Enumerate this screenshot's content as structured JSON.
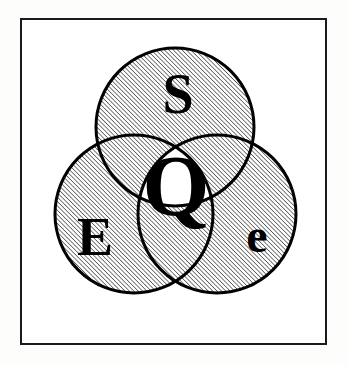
{
  "figure": {
    "background_color": "#fdfdfb",
    "ink_color": "#000000"
  },
  "frame": {
    "name": "outer-border",
    "x": 21,
    "y": 19,
    "width": 305,
    "height": 325,
    "stroke_width": 2,
    "stroke_color": "#1a1a1a",
    "fill_color": "#ffffff"
  },
  "hatch": {
    "angle_degrees": 45,
    "direction": "forward-slash",
    "spacing_px": 3.1,
    "line_width_px": 1.1,
    "line_color": "#111111",
    "background_color": "#ffffff"
  },
  "circles": [
    {
      "id": "circle-top",
      "label": "S",
      "label_case": "uppercase",
      "cx": 175,
      "cy": 127,
      "r": 79,
      "stroke_width": 3,
      "fill": "hatched"
    },
    {
      "id": "circle-left",
      "label": "E",
      "label_case": "uppercase",
      "cx": 134,
      "cy": 214,
      "r": 79,
      "stroke_width": 3,
      "fill": "hatched"
    },
    {
      "id": "circle-right",
      "label": "e",
      "label_case": "lowercase",
      "cx": 217,
      "cy": 214,
      "r": 79,
      "stroke_width": 3,
      "fill": "hatched"
    }
  ],
  "center_region": {
    "id": "triple-intersection",
    "label": "Q",
    "fill": "white",
    "description": "central triple-overlap lens left unhatched"
  },
  "labels": [
    {
      "id": "label-S",
      "text": "S",
      "x": 178,
      "y": 113,
      "font_size": 56
    },
    {
      "id": "label-E",
      "text": "E",
      "x": 95,
      "y": 255,
      "font_size": 54
    },
    {
      "id": "label-e",
      "text": "e",
      "x": 257,
      "y": 252,
      "font_size": 48
    },
    {
      "id": "label-Q",
      "text": "Q",
      "x": 176,
      "y": 215,
      "font_size": 86
    }
  ]
}
